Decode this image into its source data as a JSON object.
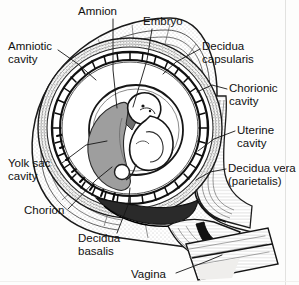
{
  "figure": {
    "background_color": "#fdfdfc",
    "ink_color": "#101010",
    "yolk_sac_fill": "#9c9c9c",
    "amniotic_fill": "#ffffff",
    "decidua_shade": "#d8d6d2",
    "width": 299,
    "height": 285
  },
  "labels": [
    {
      "id": "amnion",
      "text": "Amnion",
      "x": 78,
      "y": 5,
      "align": "left"
    },
    {
      "id": "embryo",
      "text": "Embryo",
      "x": 143,
      "y": 15,
      "align": "left"
    },
    {
      "id": "amniotic-cavity",
      "text": "Amniotic\ncavity",
      "x": 8,
      "y": 40,
      "align": "left"
    },
    {
      "id": "decidua-capsularis",
      "text": "Decidua\ncapsularis",
      "x": 202,
      "y": 40,
      "align": "left"
    },
    {
      "id": "chorionic-cavity",
      "text": "Chorionic\ncavity",
      "x": 229,
      "y": 82,
      "align": "left"
    },
    {
      "id": "uterine-cavity",
      "text": "Uterine\ncavity",
      "x": 237,
      "y": 124,
      "align": "left"
    },
    {
      "id": "decidua-vera",
      "text": "Decidua vera\n(parietalis)",
      "x": 228,
      "y": 162,
      "align": "left"
    },
    {
      "id": "yolk-sac-cavity",
      "text": "Yolk sac\ncavity",
      "x": 8,
      "y": 157,
      "align": "left"
    },
    {
      "id": "chorion",
      "text": "Chorion",
      "x": 24,
      "y": 204,
      "align": "left"
    },
    {
      "id": "decidua-basalis",
      "text": "Decidua\nbasalis",
      "x": 78,
      "y": 232,
      "align": "left"
    },
    {
      "id": "vagina",
      "text": "Vagina",
      "x": 131,
      "y": 268,
      "align": "left"
    }
  ],
  "leader_lines": [
    {
      "id": "amnion",
      "points": "113,19 113,70 117,108"
    },
    {
      "id": "embryo",
      "points": "152,29 147,60 133,107"
    },
    {
      "id": "amniotic-cavity",
      "points": "58,50 78,64 96,80"
    },
    {
      "id": "decidua-capsularis",
      "points": "200,49 176,62 163,74"
    },
    {
      "id": "chorionic-cavity",
      "points": "227,89 212,85 197,92"
    },
    {
      "id": "uterine-cavity",
      "points": "235,131 214,139 198,151"
    },
    {
      "id": "decidua-vera",
      "points": "226,169 210,172 196,180"
    },
    {
      "id": "yolk-sac-cavity",
      "points": "62,163 86,145 107,141"
    },
    {
      "id": "chorion",
      "points": "68,209 96,180 112,167"
    },
    {
      "id": "decidua-basalis",
      "points": "117,233 128,205 130,188"
    },
    {
      "id": "vagina",
      "points": "176,273 205,262 222,255"
    }
  ],
  "structures": [
    {
      "id": "uterine-wall",
      "name": "Uterine wall / decidua vera (parietalis)"
    },
    {
      "id": "decidua-capsularis-ring",
      "name": "Decidua capsularis"
    },
    {
      "id": "chorion-ring",
      "name": "Chorion with villi"
    },
    {
      "id": "chorionic-cavity-space",
      "name": "Chorionic cavity"
    },
    {
      "id": "amnion-membrane",
      "name": "Amnion"
    },
    {
      "id": "amniotic-cavity-space",
      "name": "Amniotic cavity"
    },
    {
      "id": "embryo-body",
      "name": "Embryo"
    },
    {
      "id": "yolk-sac",
      "name": "Yolk sac cavity"
    },
    {
      "id": "decidua-basalis-region",
      "name": "Decidua basalis"
    },
    {
      "id": "cervix",
      "name": "Cervix"
    },
    {
      "id": "vaginal-canal",
      "name": "Vagina"
    }
  ]
}
